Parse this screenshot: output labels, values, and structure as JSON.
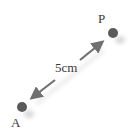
{
  "diagram": {
    "points": [
      {
        "label": "P",
        "x": 113,
        "y": 33
      },
      {
        "label": "A",
        "x": 22,
        "y": 107
      }
    ],
    "distance_label": "5cm",
    "arrow": {
      "from": [
        101,
        43
      ],
      "to": [
        32,
        98
      ],
      "double_headed": true
    },
    "colors": {
      "point": "#5a5a5a",
      "arrow": "#707070",
      "text": "#3a3a3a",
      "shadow": "#d8d8d8"
    }
  }
}
